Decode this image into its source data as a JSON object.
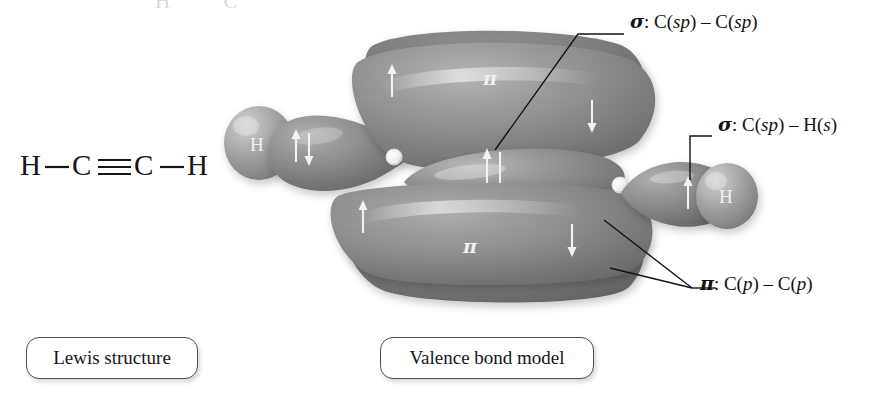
{
  "page": {
    "width": 895,
    "height": 412,
    "background": "#ffffff",
    "molecule": "acetylene (ethyne)",
    "bleed_artifact": "H   C"
  },
  "lewis": {
    "atoms": [
      "H",
      "C",
      "C",
      "H"
    ],
    "bond_left": "single",
    "bond_center": "triple",
    "bond_right": "single",
    "formula_text": "H—C≡C—H"
  },
  "captions": {
    "lewis_label": "Lewis structure",
    "valence_bond_label": "Valence bond model"
  },
  "annotations": [
    {
      "id": "sigma-cc",
      "symbol": "σ",
      "text": ": C(sp) – C(sp)",
      "full": "σ: C(sp) – C(sp)",
      "orbital_left": "C(sp)",
      "orbital_right": "C(sp)",
      "bond_type": "sigma"
    },
    {
      "id": "sigma-ch",
      "symbol": "σ",
      "text": ": C(sp) – H(s)",
      "full": "σ: C(sp) – H(s)",
      "orbital_left": "C(sp)",
      "orbital_right": "H(s)",
      "bond_type": "sigma"
    },
    {
      "id": "pi-cp",
      "symbol": "π",
      "text": ": C(p) – C(p)",
      "full": "π: C(p) – C(p)",
      "orbital_left": "C(p)",
      "orbital_right": "C(p)",
      "bond_type": "pi"
    }
  ],
  "orbital_model": {
    "atom_nodes": [
      {
        "label": "C",
        "side": "left"
      },
      {
        "label": "C",
        "side": "right"
      }
    ],
    "hydrogen_spheres": [
      {
        "label": "H",
        "side": "left"
      },
      {
        "label": "H",
        "side": "right"
      }
    ],
    "pi_labels": [
      {
        "label": "π",
        "position": "top"
      },
      {
        "label": "π",
        "position": "bottom"
      }
    ],
    "electron_arrows": [
      {
        "name": "h-left-sp-pair",
        "type": "paired",
        "glyph": "↑↓"
      },
      {
        "name": "sigma-cc-pair",
        "type": "paired",
        "glyph": "↑↓"
      },
      {
        "name": "h-right-sp-pair",
        "type": "paired",
        "glyph": "↑↓"
      },
      {
        "name": "pi-top-left",
        "type": "up",
        "glyph": "↑"
      },
      {
        "name": "pi-top-right",
        "type": "down",
        "glyph": "↓"
      },
      {
        "name": "pi-bottom-left",
        "type": "up",
        "glyph": "↑"
      },
      {
        "name": "pi-bottom-right",
        "type": "down",
        "glyph": "↓"
      }
    ],
    "colors": {
      "lobe_fill": "#8a8a8a",
      "lobe_fill_dark": "#6f6f6f",
      "lobe_fill_light": "#9d9d9d",
      "hydrogen_fill": "#a8a8a8",
      "arrow": "#f2f2f2",
      "leader_line": "#141414"
    }
  }
}
